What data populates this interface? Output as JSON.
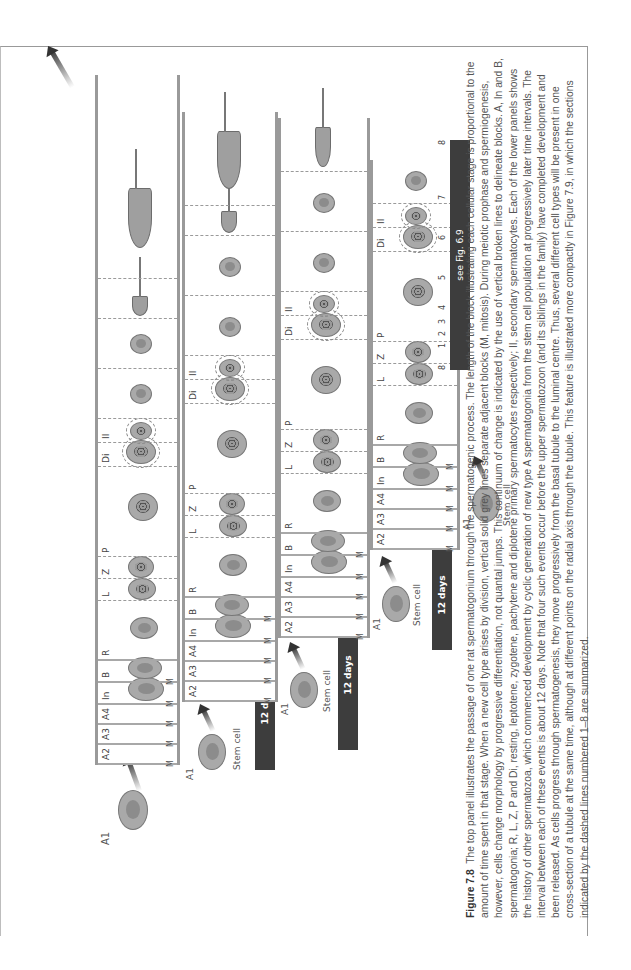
{
  "figure": {
    "number": "Figure 7.8",
    "caption": "The top panel illustrates the passage of one rat spermatogonium through the spermatogenic process. The length of the block illustrating each cellular stage is proportional to the amount of time spent in that stage. When a new cell type arises by division, vertical solid grey lines separate adjacent blocks (M, mitosis). During meiotic prophase and spermiogenesis, however, cells change morphology by progressive differentiation, not quantal jumps. This continuum of change is indicated by the use of vertical broken lines to delineate blocks. A, In and B, spermatogonia; R, L, Z, P and Di, resting, leptotene, zygotene, pachytene and diplotene primary spermatocytes respectively; II, secondary spermatocytes. Each of the lower panels shows the history of other spermatozoa, which commenced development by cyclic generation of new type A spermatogonia from the stem cell population at progressively later time intervals. The interval between each of these events is about 12 days. Note that four such events occur before the upper spermatozoon (and its siblings in the family) have completed development and been released. As cells progress through spermatogenesis, they move progressively from the basal tubule to the luminal centre. Thus, several different cell types will be present in one cross-section of a tubule at the same time, although at different points on the radial axis through the tubule. This feature is illustrated more compactly in Figure 7.9, in which the sections indicated by the dashed lines numbered 1–8 are summarized."
  },
  "diagram": {
    "start_label": "A1",
    "stem_cell_label": "Stem cell",
    "mitosis_label": "M",
    "interval_label": "12 days",
    "stage_labels": [
      "A2",
      "A3",
      "A4",
      "In",
      "B",
      "R",
      "L",
      "Z",
      "P",
      "Di",
      "II"
    ],
    "panels": [
      {
        "name": "panel-1",
        "labels": [
          "A2",
          "A3",
          "A4",
          "In",
          "B",
          "R",
          "L",
          "Z",
          "P",
          "Di",
          "II"
        ]
      },
      {
        "name": "panel-2",
        "labels": [
          "A1",
          "A2",
          "A3",
          "A4",
          "In",
          "B",
          "R",
          "L",
          "Z",
          "P",
          "Di",
          "II"
        ]
      },
      {
        "name": "panel-3",
        "labels": [
          "A1",
          "A2",
          "A3",
          "A4",
          "In",
          "B",
          "R",
          "L",
          "Z",
          "P",
          "Di",
          "II"
        ]
      },
      {
        "name": "panel-4",
        "labels": [
          "A1",
          "A2",
          "A3",
          "A4",
          "In",
          "B",
          "R",
          "L",
          "Z",
          "P",
          "Di",
          "II"
        ]
      },
      {
        "name": "panel-5",
        "labels": [
          "A1",
          "A2"
        ]
      }
    ],
    "section_ticks": [
      "8",
      "1",
      "2",
      "3",
      "4",
      "5",
      "6",
      "7",
      "8"
    ],
    "see_fig_label": "see Fig. 6.9"
  }
}
